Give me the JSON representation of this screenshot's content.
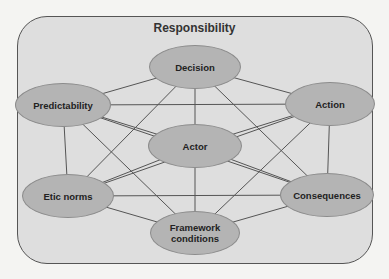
{
  "diagram": {
    "title": "Responsibility",
    "nodes": [
      {
        "id": "decision",
        "label": "Decision",
        "cx": 195,
        "cy": 67,
        "w": 92,
        "h": 44
      },
      {
        "id": "predictability",
        "label": "Predictability",
        "cx": 63,
        "cy": 105,
        "w": 96,
        "h": 44
      },
      {
        "id": "action",
        "label": "Action",
        "cx": 330,
        "cy": 104,
        "w": 90,
        "h": 44
      },
      {
        "id": "actor",
        "label": "Actor",
        "cx": 195,
        "cy": 146,
        "w": 94,
        "h": 44
      },
      {
        "id": "etic-norms",
        "label": "Etic norms",
        "cx": 68,
        "cy": 196,
        "w": 92,
        "h": 44
      },
      {
        "id": "consequences",
        "label": "Consequences",
        "cx": 327,
        "cy": 195,
        "w": 94,
        "h": 44
      },
      {
        "id": "framework-conditions",
        "label": "Framework conditions",
        "cx": 195,
        "cy": 233,
        "w": 90,
        "h": 44
      }
    ],
    "edges": [
      [
        "decision",
        "predictability"
      ],
      [
        "decision",
        "action"
      ],
      [
        "decision",
        "actor"
      ],
      [
        "decision",
        "etic-norms"
      ],
      [
        "decision",
        "consequences"
      ],
      [
        "predictability",
        "action"
      ],
      [
        "predictability",
        "actor"
      ],
      [
        "predictability",
        "etic-norms"
      ],
      [
        "predictability",
        "framework-conditions"
      ],
      [
        "predictability",
        "consequences"
      ],
      [
        "action",
        "actor"
      ],
      [
        "action",
        "consequences"
      ],
      [
        "action",
        "framework-conditions"
      ],
      [
        "action",
        "etic-norms"
      ],
      [
        "actor",
        "etic-norms"
      ],
      [
        "actor",
        "consequences"
      ],
      [
        "actor",
        "framework-conditions"
      ],
      [
        "etic-norms",
        "consequences"
      ],
      [
        "etic-norms",
        "framework-conditions"
      ],
      [
        "consequences",
        "framework-conditions"
      ]
    ],
    "colors": {
      "frame_fill": "#dedede",
      "frame_border": "#555555",
      "node_fill": "#b4b4b4",
      "node_border": "#8c8c8c",
      "edge": "#555555"
    }
  }
}
